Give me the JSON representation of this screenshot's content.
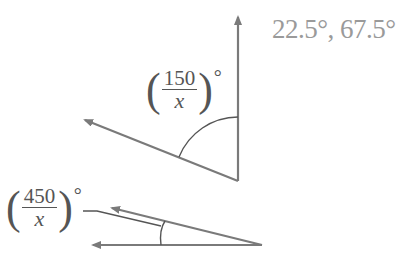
{
  "answer": "22.5°, 67.5°",
  "figure_top": {
    "label": {
      "open": "(",
      "numerator": "150",
      "denominator": "x",
      "close": ")",
      "degree": "°"
    }
  },
  "figure_bottom": {
    "label": {
      "open": "(",
      "numerator": "450",
      "denominator": "x",
      "close": ")",
      "degree": "°"
    }
  },
  "colors": {
    "line": "#7a7a7a",
    "text": "#555555",
    "answer": "#9a9a9a"
  }
}
